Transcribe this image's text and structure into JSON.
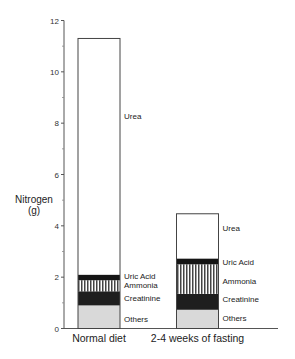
{
  "chart_data": {
    "type": "bar",
    "stacked": true,
    "title": "",
    "xlabel": "",
    "ylabel": "Nitrogen",
    "ylabel_unit": "(g)",
    "ylim": [
      0,
      12
    ],
    "yticks": [
      0,
      2,
      4,
      6,
      8,
      10,
      12
    ],
    "yticks_minor": [
      1,
      3,
      5,
      7,
      9,
      11
    ],
    "grid": false,
    "legend": "inline-right-of-bars",
    "categories": [
      "Normal diet",
      "2-4 weeks of fasting"
    ],
    "series": [
      {
        "name": "Others",
        "values": [
          0.9,
          0.73
        ],
        "fill": "#d9d9d9",
        "pattern": "solid"
      },
      {
        "name": "Creatinine",
        "values": [
          0.55,
          0.62
        ],
        "fill": "#1e1e1e",
        "pattern": "solid"
      },
      {
        "name": "Ammonia",
        "values": [
          0.43,
          1.15
        ],
        "fill": "#ffffff",
        "pattern": "vertical-stripes"
      },
      {
        "name": "Uric Acid",
        "values": [
          0.22,
          0.23
        ],
        "fill": "#151515",
        "pattern": "solid"
      },
      {
        "name": "Urea",
        "values": [
          9.2,
          1.74
        ],
        "fill": "#ffffff",
        "pattern": "solid"
      }
    ],
    "totals": [
      11.3,
      4.47
    ]
  }
}
